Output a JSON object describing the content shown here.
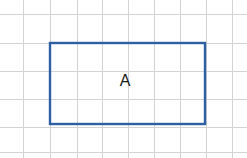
{
  "figure": {
    "canvas": {
      "width": 247,
      "height": 158,
      "background_color": "#ffffff"
    },
    "grid": {
      "line_color": "#d3d3d3",
      "line_width": 1,
      "spacing_x": 26,
      "spacing_y": 28,
      "vertical_line_x": [
        23,
        50,
        77,
        102,
        128,
        154,
        180,
        206,
        232
      ],
      "horizontal_line_y": [
        14,
        43,
        71,
        99,
        127,
        152
      ]
    },
    "shapes": [
      {
        "kind": "rectangle",
        "label": "A",
        "label_color": "#1a1a1a",
        "stroke_color": "#2e5fa3",
        "stroke_width": 2.4,
        "fill": "none",
        "x": 50,
        "y": 43,
        "width": 155,
        "height": 81,
        "label_x": 125,
        "label_y": 82,
        "grid_units_wide": 6,
        "grid_units_tall": 3
      }
    ]
  }
}
